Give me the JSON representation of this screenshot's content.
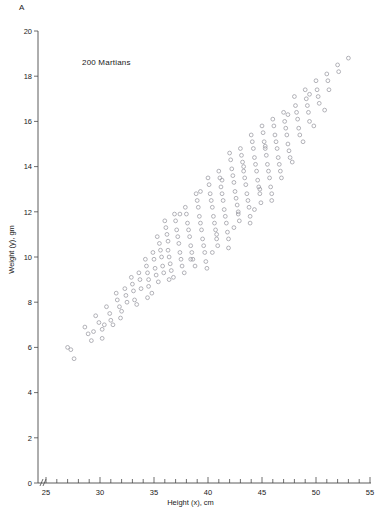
{
  "panel": {
    "label": "A"
  },
  "annotation": {
    "text": "200 Martians"
  },
  "axes": {
    "x": {
      "label": "Height (x), cm",
      "min": 24,
      "max": 55,
      "major_ticks": [
        25,
        30,
        35,
        40,
        45,
        50,
        55
      ],
      "major_tick_labels": [
        "25",
        "30",
        "35",
        "40",
        "45",
        "50",
        "55"
      ],
      "minor_tick_step": 1,
      "break_marker": true
    },
    "y": {
      "label": "Weight (y), gm",
      "min": 0,
      "max": 20,
      "major_ticks": [
        0,
        2,
        4,
        6,
        8,
        10,
        12,
        14,
        16,
        18,
        20
      ],
      "major_tick_labels": [
        "0",
        "2",
        "4",
        "6",
        "8",
        "10",
        "12",
        "14",
        "16",
        "18",
        "20"
      ]
    }
  },
  "style": {
    "point_color": "#9a9aa2",
    "axis_color": "#4a4a4a",
    "text_color": "#1a1a1a",
    "background": "#ffffff",
    "point_radius": 1.9
  },
  "chart_data": {
    "type": "scatter",
    "title": "",
    "subtitle": "",
    "annotations": [
      "A",
      "200 Martians"
    ],
    "xlabel": "Height (x), cm",
    "ylabel": "Weight (y), gm",
    "xlim": [
      24,
      55
    ],
    "ylim": [
      0,
      20
    ],
    "grid": false,
    "legend": null,
    "n_points": 200,
    "marker": "open-circle",
    "series": [
      {
        "name": "Martians",
        "points": [
          [
            27.0,
            6.0
          ],
          [
            27.3,
            5.9
          ],
          [
            27.6,
            5.5
          ],
          [
            28.6,
            6.9
          ],
          [
            28.9,
            6.6
          ],
          [
            29.2,
            6.3
          ],
          [
            29.6,
            7.4
          ],
          [
            29.9,
            7.1
          ],
          [
            30.2,
            6.8
          ],
          [
            30.2,
            6.4
          ],
          [
            30.6,
            7.8
          ],
          [
            30.9,
            7.5
          ],
          [
            31.0,
            7.2
          ],
          [
            31.5,
            8.4
          ],
          [
            31.6,
            8.1
          ],
          [
            31.8,
            7.8
          ],
          [
            31.9,
            7.3
          ],
          [
            32.3,
            8.6
          ],
          [
            32.4,
            8.3
          ],
          [
            32.5,
            8.0
          ],
          [
            32.9,
            9.1
          ],
          [
            33.0,
            8.8
          ],
          [
            33.1,
            8.5
          ],
          [
            33.2,
            8.1
          ],
          [
            33.6,
            9.3
          ],
          [
            33.7,
            9.0
          ],
          [
            33.8,
            8.6
          ],
          [
            34.2,
            9.9
          ],
          [
            34.3,
            9.6
          ],
          [
            34.4,
            9.3
          ],
          [
            34.5,
            9.0
          ],
          [
            34.5,
            8.7
          ],
          [
            34.9,
            10.2
          ],
          [
            35.0,
            9.9
          ],
          [
            35.1,
            9.5
          ],
          [
            35.2,
            9.2
          ],
          [
            35.5,
            10.6
          ],
          [
            35.6,
            10.3
          ],
          [
            35.7,
            10.0
          ],
          [
            35.8,
            9.6
          ],
          [
            35.9,
            9.3
          ],
          [
            36.0,
            11.6
          ],
          [
            36.1,
            11.3
          ],
          [
            36.2,
            11.0
          ],
          [
            36.3,
            10.7
          ],
          [
            36.3,
            10.3
          ],
          [
            36.4,
            10.0
          ],
          [
            36.5,
            9.7
          ],
          [
            36.6,
            9.4
          ],
          [
            36.9,
            11.9
          ],
          [
            37.0,
            11.6
          ],
          [
            37.1,
            11.2
          ],
          [
            37.2,
            10.9
          ],
          [
            37.3,
            10.6
          ],
          [
            37.4,
            10.2
          ],
          [
            37.5,
            9.9
          ],
          [
            37.6,
            9.6
          ],
          [
            37.9,
            12.2
          ],
          [
            38.0,
            11.9
          ],
          [
            38.1,
            11.5
          ],
          [
            38.2,
            11.2
          ],
          [
            38.3,
            10.9
          ],
          [
            38.4,
            10.5
          ],
          [
            38.5,
            10.2
          ],
          [
            38.6,
            9.9
          ],
          [
            38.9,
            12.8
          ],
          [
            39.0,
            12.5
          ],
          [
            39.1,
            12.2
          ],
          [
            39.2,
            11.8
          ],
          [
            39.3,
            11.5
          ],
          [
            39.4,
            11.2
          ],
          [
            39.5,
            10.8
          ],
          [
            39.6,
            10.5
          ],
          [
            39.7,
            10.2
          ],
          [
            39.8,
            9.8
          ],
          [
            40.0,
            13.5
          ],
          [
            40.1,
            13.2
          ],
          [
            40.2,
            12.8
          ],
          [
            40.3,
            12.5
          ],
          [
            40.4,
            12.2
          ],
          [
            40.5,
            11.8
          ],
          [
            40.6,
            11.5
          ],
          [
            40.7,
            11.2
          ],
          [
            40.8,
            10.8
          ],
          [
            40.9,
            10.5
          ],
          [
            41.0,
            13.8
          ],
          [
            41.1,
            13.5
          ],
          [
            41.2,
            13.1
          ],
          [
            41.3,
            12.8
          ],
          [
            41.4,
            12.5
          ],
          [
            41.5,
            12.1
          ],
          [
            41.6,
            11.8
          ],
          [
            41.7,
            11.5
          ],
          [
            41.8,
            11.1
          ],
          [
            41.9,
            10.8
          ],
          [
            42.0,
            14.6
          ],
          [
            42.1,
            14.3
          ],
          [
            42.2,
            13.9
          ],
          [
            42.3,
            13.6
          ],
          [
            42.4,
            13.3
          ],
          [
            42.5,
            12.9
          ],
          [
            42.6,
            12.6
          ],
          [
            42.7,
            12.3
          ],
          [
            42.8,
            11.9
          ],
          [
            42.9,
            11.6
          ],
          [
            43.0,
            14.8
          ],
          [
            43.1,
            14.5
          ],
          [
            43.2,
            14.2
          ],
          [
            43.3,
            13.8
          ],
          [
            43.4,
            13.5
          ],
          [
            43.5,
            13.2
          ],
          [
            43.6,
            12.8
          ],
          [
            43.7,
            12.5
          ],
          [
            43.8,
            12.2
          ],
          [
            43.9,
            11.8
          ],
          [
            44.0,
            15.4
          ],
          [
            44.1,
            15.1
          ],
          [
            44.2,
            14.8
          ],
          [
            44.3,
            14.4
          ],
          [
            44.4,
            14.1
          ],
          [
            44.5,
            13.8
          ],
          [
            44.6,
            13.4
          ],
          [
            44.7,
            13.1
          ],
          [
            44.8,
            12.8
          ],
          [
            44.9,
            12.4
          ],
          [
            45.0,
            15.8
          ],
          [
            45.1,
            15.5
          ],
          [
            45.2,
            15.1
          ],
          [
            45.3,
            14.8
          ],
          [
            45.4,
            14.5
          ],
          [
            45.5,
            14.1
          ],
          [
            45.6,
            13.8
          ],
          [
            45.7,
            13.5
          ],
          [
            45.8,
            13.1
          ],
          [
            45.9,
            12.8
          ],
          [
            46.0,
            16.1
          ],
          [
            46.1,
            15.8
          ],
          [
            46.2,
            15.4
          ],
          [
            46.3,
            15.1
          ],
          [
            46.4,
            14.8
          ],
          [
            46.5,
            14.4
          ],
          [
            46.6,
            14.1
          ],
          [
            46.7,
            13.8
          ],
          [
            47.0,
            16.4
          ],
          [
            47.1,
            16.0
          ],
          [
            47.2,
            15.7
          ],
          [
            47.3,
            15.4
          ],
          [
            47.4,
            15.0
          ],
          [
            47.5,
            14.7
          ],
          [
            47.6,
            14.4
          ],
          [
            48.0,
            17.1
          ],
          [
            48.1,
            16.7
          ],
          [
            48.2,
            16.4
          ],
          [
            48.3,
            16.1
          ],
          [
            48.4,
            15.7
          ],
          [
            48.5,
            15.4
          ],
          [
            49.0,
            17.4
          ],
          [
            49.1,
            17.0
          ],
          [
            49.2,
            16.7
          ],
          [
            49.3,
            16.4
          ],
          [
            49.4,
            16.0
          ],
          [
            50.0,
            17.8
          ],
          [
            50.1,
            17.4
          ],
          [
            50.2,
            17.1
          ],
          [
            50.3,
            16.8
          ],
          [
            51.0,
            18.1
          ],
          [
            51.1,
            17.8
          ],
          [
            51.2,
            17.4
          ],
          [
            52.0,
            18.5
          ],
          [
            52.1,
            18.2
          ],
          [
            53.0,
            18.8
          ],
          [
            33.4,
            7.9
          ],
          [
            34.8,
            8.4
          ],
          [
            35.4,
            8.9
          ],
          [
            36.8,
            9.1
          ],
          [
            37.8,
            9.3
          ],
          [
            38.8,
            9.6
          ],
          [
            39.9,
            9.5
          ],
          [
            41.9,
            10.4
          ],
          [
            43.9,
            11.5
          ],
          [
            45.9,
            12.5
          ],
          [
            44.3,
            12.1
          ],
          [
            42.4,
            11.3
          ],
          [
            40.4,
            10.2
          ],
          [
            38.4,
            9.9
          ],
          [
            36.4,
            9.0
          ],
          [
            34.4,
            8.2
          ],
          [
            30.4,
            7.0
          ],
          [
            32.0,
            7.6
          ],
          [
            31.2,
            7.0
          ],
          [
            29.4,
            6.7
          ],
          [
            46.8,
            13.5
          ],
          [
            47.8,
            14.2
          ],
          [
            48.8,
            15.1
          ],
          [
            49.8,
            15.8
          ],
          [
            50.8,
            16.5
          ],
          [
            44.8,
            13.0
          ],
          [
            42.8,
            12.0
          ],
          [
            40.8,
            11.0
          ],
          [
            37.4,
            11.9
          ],
          [
            35.3,
            10.9
          ],
          [
            39.3,
            12.9
          ],
          [
            41.3,
            13.4
          ],
          [
            43.3,
            14.0
          ],
          [
            45.3,
            14.9
          ],
          [
            47.4,
            16.3
          ],
          [
            49.4,
            17.2
          ]
        ]
      }
    ]
  }
}
